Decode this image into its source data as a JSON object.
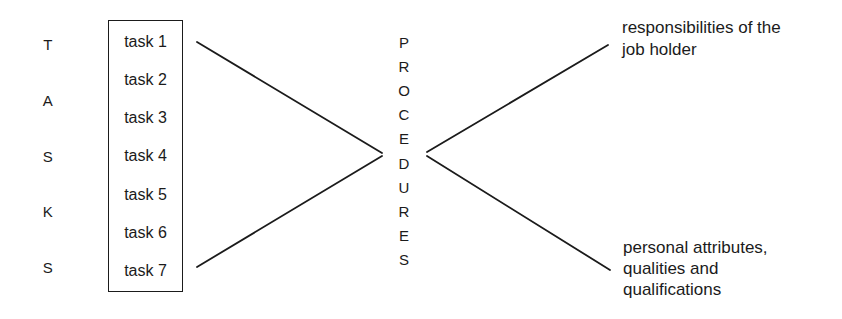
{
  "page": {
    "background_color": "#ffffff",
    "ink_color": "#1b1b1b",
    "description_visible_words": "TASKS PROCEDURES task list diagram"
  },
  "tasks_word": {
    "word": "TASKS",
    "letters": [
      "T",
      "A",
      "S",
      "K",
      "S"
    ]
  },
  "task_box": {
    "items": [
      "task 1",
      "task 2",
      "task 3",
      "task 4",
      "task 5",
      "task 6",
      "task 7"
    ]
  },
  "procedures_word": {
    "word": "PROCEDURES",
    "letters": [
      "P",
      "R",
      "O",
      "C",
      "E",
      "D",
      "U",
      "R",
      "E",
      "S"
    ]
  },
  "outputs": {
    "top": {
      "text": "responsibilities of the job holder",
      "lines": [
        "responsibilities of the",
        "job holder"
      ]
    },
    "bottom": {
      "text": "personal attributes, qualities and qualifications",
      "lines": [
        "personal attributes,",
        "qualities and",
        "qualifications"
      ]
    }
  }
}
